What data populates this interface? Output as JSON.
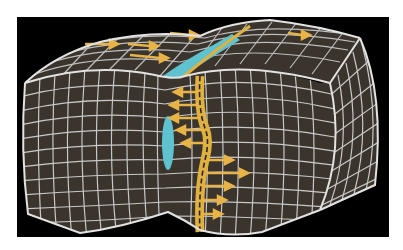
{
  "diagram": {
    "colors": {
      "background": "#000000",
      "page": "#ffffff",
      "block_fill": "#3a342c",
      "grid_line": "#cfcfcf",
      "outline": "#e2e2e2",
      "fault_band": "#e0b040",
      "arrow": "#e8b448",
      "cavity": "#5fc3cf"
    },
    "elements": {
      "block": "gridded-block",
      "fault": "fault-trace",
      "arrows_left": 5,
      "arrows_right": 5,
      "arrows_top": 5,
      "cavities": 2
    }
  }
}
